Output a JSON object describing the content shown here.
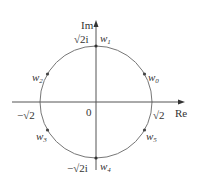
{
  "diagram": {
    "type": "complex-plane-roots",
    "axes": {
      "real_label": "Re",
      "imag_label": "Im",
      "origin_label": "0"
    },
    "circle": {
      "radius_label": "√2",
      "neg_radius_label": "−√2",
      "top_label": "√2i",
      "bottom_label": "−√2i"
    },
    "points": [
      {
        "name": "w",
        "sub": "0",
        "angle_deg": 30
      },
      {
        "name": "w",
        "sub": "1",
        "angle_deg": 90
      },
      {
        "name": "w",
        "sub": "2",
        "angle_deg": 150
      },
      {
        "name": "w",
        "sub": "3",
        "angle_deg": 210
      },
      {
        "name": "w",
        "sub": "4",
        "angle_deg": 270
      },
      {
        "name": "w",
        "sub": "5",
        "angle_deg": 330
      }
    ],
    "colors": {
      "stroke": "#555555",
      "circle": "#777777",
      "text": "#333333"
    }
  }
}
